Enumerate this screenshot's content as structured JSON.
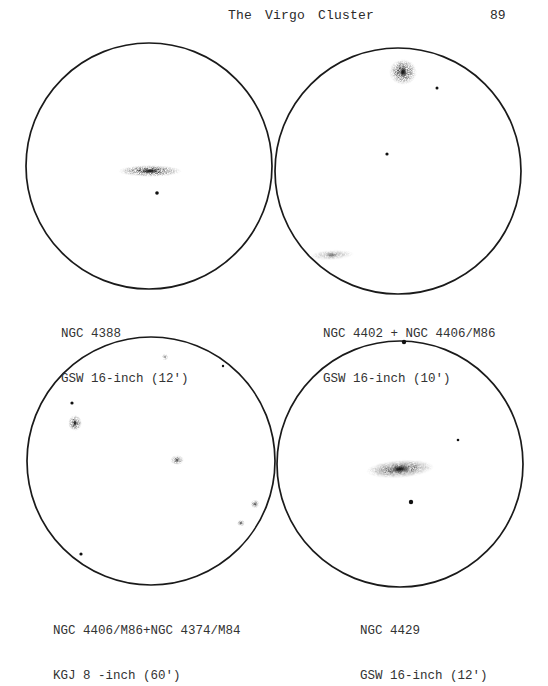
{
  "header": {
    "title": "The Virgo Cluster",
    "page_number": "89"
  },
  "sketches": [
    {
      "id": "ngc4388",
      "caption_line1": "NGC 4388",
      "caption_line2": "GSW 16-inch (12')",
      "circle": {
        "cx": 149,
        "cy": 166,
        "r": 123
      },
      "galaxies": [
        {
          "cx": 150,
          "cy": 171,
          "rx": 32,
          "ry": 6,
          "density": "dark",
          "rotate": 0
        }
      ],
      "stars": [
        {
          "cx": 157,
          "cy": 193,
          "r": 1.8
        }
      ]
    },
    {
      "id": "ngc4402-ngc4406",
      "caption_line1": "NGC 4402 + NGC 4406/M86",
      "caption_line2": "GSW 16-inch (10')",
      "circle": {
        "cx": 398,
        "cy": 171,
        "r": 123
      },
      "galaxies": [
        {
          "cx": 403,
          "cy": 72,
          "rx": 14,
          "ry": 13,
          "density": "dark",
          "rotate": 0
        },
        {
          "cx": 332,
          "cy": 255,
          "rx": 22,
          "ry": 5,
          "density": "light",
          "rotate": -3
        }
      ],
      "stars": [
        {
          "cx": 437,
          "cy": 88,
          "r": 1.5
        },
        {
          "cx": 387,
          "cy": 154,
          "r": 1.6
        }
      ]
    },
    {
      "id": "ngc4406-ngc4374",
      "caption_line1": "NGC 4406/M86+NGC 4374/M84",
      "caption_line2": "KGJ 8 -inch (60')",
      "circle": {
        "cx": 151,
        "cy": 461,
        "r": 124
      },
      "galaxies": [
        {
          "cx": 165,
          "cy": 357,
          "rx": 3.5,
          "ry": 3.5,
          "density": "light",
          "rotate": 0
        },
        {
          "cx": 75,
          "cy": 423,
          "rx": 7,
          "ry": 8,
          "density": "dark",
          "rotate": 0
        },
        {
          "cx": 177,
          "cy": 460,
          "rx": 7,
          "ry": 5,
          "density": "medium",
          "rotate": 0
        },
        {
          "cx": 255,
          "cy": 504,
          "rx": 4.5,
          "ry": 4.5,
          "density": "medium",
          "rotate": 0
        },
        {
          "cx": 241,
          "cy": 523,
          "rx": 4,
          "ry": 3.5,
          "density": "medium",
          "rotate": 0
        }
      ],
      "stars": [
        {
          "cx": 223,
          "cy": 366,
          "r": 1.2
        },
        {
          "cx": 72,
          "cy": 403,
          "r": 1.6
        },
        {
          "cx": 81,
          "cy": 554,
          "r": 1.6
        }
      ]
    },
    {
      "id": "ngc4429",
      "caption_line1": "NGC 4429",
      "caption_line2": "GSW 16-inch (12')",
      "circle": {
        "cx": 400,
        "cy": 464,
        "r": 123
      },
      "galaxies": [
        {
          "cx": 400,
          "cy": 469,
          "rx": 34,
          "ry": 9,
          "density": "dark",
          "rotate": -4
        }
      ],
      "stars": [
        {
          "cx": 404,
          "cy": 342,
          "r": 2.2
        },
        {
          "cx": 458,
          "cy": 440,
          "r": 1.3
        },
        {
          "cx": 411,
          "cy": 502,
          "r": 2.2
        }
      ]
    }
  ]
}
